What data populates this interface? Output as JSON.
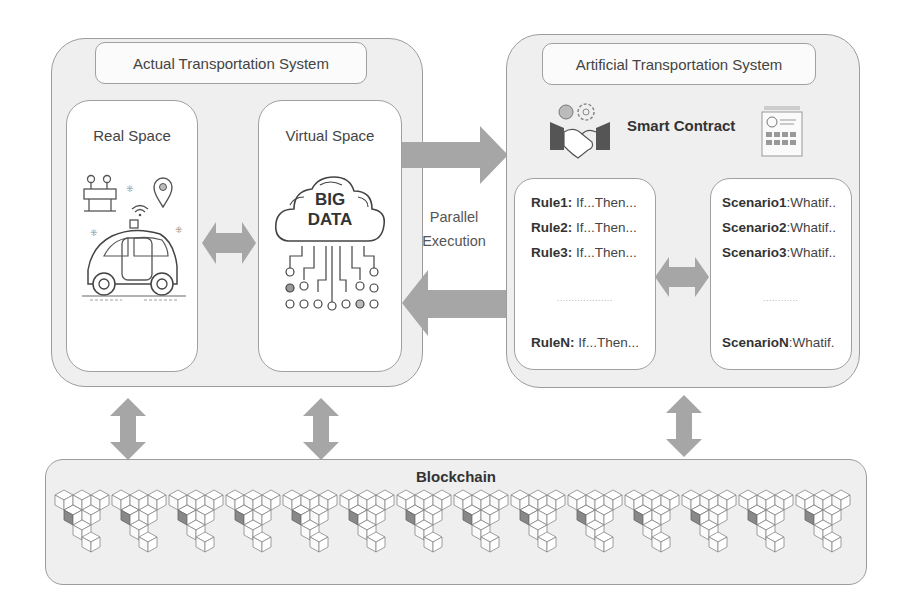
{
  "actual_system": {
    "title": "Actual Transportation System",
    "real_space": {
      "title": "Real Space",
      "icons": [
        "road-barrier-icon",
        "location-pin-icon",
        "wifi-signal-icon",
        "autonomous-car-icon"
      ]
    },
    "virtual_space": {
      "title": "Virtual Space",
      "cloud_text_line1": "BIG",
      "cloud_text_line2": "DATA",
      "icons": [
        "cloud-icon",
        "network-nodes-icon"
      ]
    }
  },
  "connector": {
    "label_line1": "Parallel",
    "label_line2": "Execution"
  },
  "artificial_system": {
    "title": "Artificial Transportation System",
    "smart_contract": {
      "title": "Smart Contract",
      "icons": [
        "handshake-gears-icon",
        "contract-document-icon"
      ]
    },
    "rules": [
      {
        "name": "Rule1:",
        "text": " If...Then..."
      },
      {
        "name": "Rule2:",
        "text": " If...Then..."
      },
      {
        "name": "Rule3:",
        "text": " If...Then..."
      },
      {
        "name": "RuleN:",
        "text": " If...Then..."
      }
    ],
    "rules_ellipsis": "...................",
    "scenarios": [
      {
        "name": "Scenario1",
        "text": ":Whatif.."
      },
      {
        "name": "Scenario2",
        "text": ":Whatif.."
      },
      {
        "name": "Scenario3",
        "text": ":Whatif.."
      },
      {
        "name": "ScenarioN",
        "text": ":Whatif."
      }
    ],
    "scenarios_ellipsis": "............"
  },
  "blockchain": {
    "title": "Blockchain",
    "block_cluster_count": 13
  },
  "colors": {
    "panel_fill": "#efefef",
    "border": "#9c9c9c",
    "arrow": "#a6a6a6",
    "inner_fill": "#ffffff"
  }
}
